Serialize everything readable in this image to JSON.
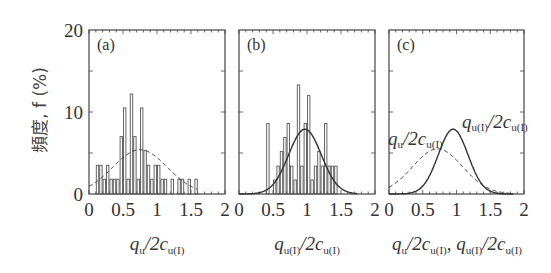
{
  "y_axis_label": "頻度, f (%)",
  "y_ticks": [
    "0",
    "10",
    "20"
  ],
  "x_ticks": [
    "0",
    "0.5",
    "1",
    "1.5",
    "2"
  ],
  "panels": [
    {
      "label": "(a)",
      "xlabel_main": "q",
      "xlabel_sub1": "u",
      "xlabel_mid": "/2c",
      "xlabel_sub2": "u(I)"
    },
    {
      "label": "(b)",
      "xlabel_main": "q",
      "xlabel_sub1": "u(I)",
      "xlabel_mid": "/2c",
      "xlabel_sub2": "u(I)"
    },
    {
      "label": "(c)",
      "xlabel_text": "q_u/2c_u(I), q_u(I)/2c_u(I)",
      "annotations": [
        "q_u/2c_u(I)",
        "q_u(I)/2c_u(I)"
      ]
    }
  ],
  "chart_data": [
    {
      "type": "bar",
      "title": "(a)",
      "xlabel": "q_u/2c_u(I)",
      "ylabel": "頻度, f (%)",
      "xlim": [
        0,
        2
      ],
      "ylim": [
        0,
        20
      ],
      "bin_width": 0.05,
      "bin_starts": [
        0.1,
        0.15,
        0.2,
        0.25,
        0.3,
        0.35,
        0.4,
        0.45,
        0.5,
        0.55,
        0.6,
        0.65,
        0.7,
        0.75,
        0.8,
        0.85,
        0.9,
        0.95,
        1.0,
        1.05,
        1.1,
        1.15,
        1.2,
        1.25,
        1.3,
        1.35,
        1.4,
        1.45,
        1.5,
        1.55
      ],
      "values": [
        3.5,
        3.5,
        1.8,
        3.5,
        1.8,
        1.8,
        1.8,
        7.0,
        10.5,
        1.8,
        12.2,
        7.0,
        1.8,
        10.5,
        5.3,
        3.5,
        1.8,
        3.5,
        3.5,
        1.8,
        1.8,
        0,
        1.8,
        0,
        1.8,
        1.8,
        0,
        1.8,
        0,
        1.8
      ],
      "fit": {
        "style": "dashed",
        "distribution": "normal",
        "mean": 0.75,
        "peak": 5.4
      }
    },
    {
      "type": "bar",
      "title": "(b)",
      "xlabel": "q_u(I)/2c_u(I)",
      "ylabel": "頻度, f (%)",
      "xlim": [
        0,
        2
      ],
      "ylim": [
        0,
        20
      ],
      "bin_width": 0.05,
      "bin_starts": [
        0.4,
        0.45,
        0.5,
        0.55,
        0.6,
        0.65,
        0.7,
        0.75,
        0.8,
        0.85,
        0.9,
        0.95,
        1.0,
        1.05,
        1.1,
        1.15,
        1.2,
        1.25,
        1.3,
        1.35,
        1.4
      ],
      "values": [
        8.6,
        0,
        1.7,
        3.4,
        5.2,
        6.9,
        8.6,
        3.4,
        1.7,
        13.3,
        3.4,
        8.6,
        12.0,
        1.7,
        3.4,
        5.2,
        3.4,
        8.6,
        3.4,
        3.4,
        3.4
      ],
      "fit": {
        "style": "solid",
        "distribution": "normal",
        "mean": 0.97,
        "peak": 7.9
      }
    },
    {
      "type": "line",
      "title": "(c)",
      "xlabel": "q_u/2c_u(I), q_u(I)/2c_u(I)",
      "xlim": [
        0,
        2
      ],
      "ylim": [
        0,
        20
      ],
      "series": [
        {
          "name": "q_u/2c_u(I)",
          "style": "dashed",
          "mean": 0.72,
          "sd": 0.37,
          "peak": 5.5
        },
        {
          "name": "q_u(I)/2c_u(I)",
          "style": "solid",
          "mean": 0.95,
          "sd": 0.22,
          "peak": 7.9
        }
      ]
    }
  ]
}
